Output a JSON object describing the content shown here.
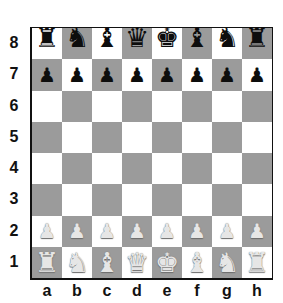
{
  "board": {
    "light_color": "#ffffff",
    "dark_color": "#9b9b9b",
    "files": [
      "a",
      "b",
      "c",
      "d",
      "e",
      "f",
      "g",
      "h"
    ],
    "ranks": [
      "8",
      "7",
      "6",
      "5",
      "4",
      "3",
      "2",
      "1"
    ],
    "position": [
      [
        "br",
        "bn",
        "bb",
        "bq",
        "bk",
        "bb",
        "bn",
        "br"
      ],
      [
        "bp",
        "bp",
        "bp",
        "bp",
        "bp",
        "bp",
        "bp",
        "bp"
      ],
      [
        "",
        "",
        "",
        "",
        "",
        "",
        "",
        ""
      ],
      [
        "",
        "",
        "",
        "",
        "",
        "",
        "",
        ""
      ],
      [
        "",
        "",
        "",
        "",
        "",
        "",
        "",
        ""
      ],
      [
        "",
        "",
        "",
        "",
        "",
        "",
        "",
        ""
      ],
      [
        "wp",
        "wp",
        "wp",
        "wp",
        "wp",
        "wp",
        "wp",
        "wp"
      ],
      [
        "wr",
        "wn",
        "wb",
        "wq",
        "wk",
        "wb",
        "wn",
        "wr"
      ]
    ]
  },
  "pieces": {
    "k": {
      "name": "king",
      "glyph": "♚"
    },
    "q": {
      "name": "queen",
      "glyph": "♛"
    },
    "r": {
      "name": "rook",
      "glyph": "♜"
    },
    "b": {
      "name": "bishop",
      "glyph": "♝"
    },
    "n": {
      "name": "knight",
      "glyph": "♞"
    },
    "p": {
      "name": "pawn",
      "glyph": "♟"
    }
  }
}
